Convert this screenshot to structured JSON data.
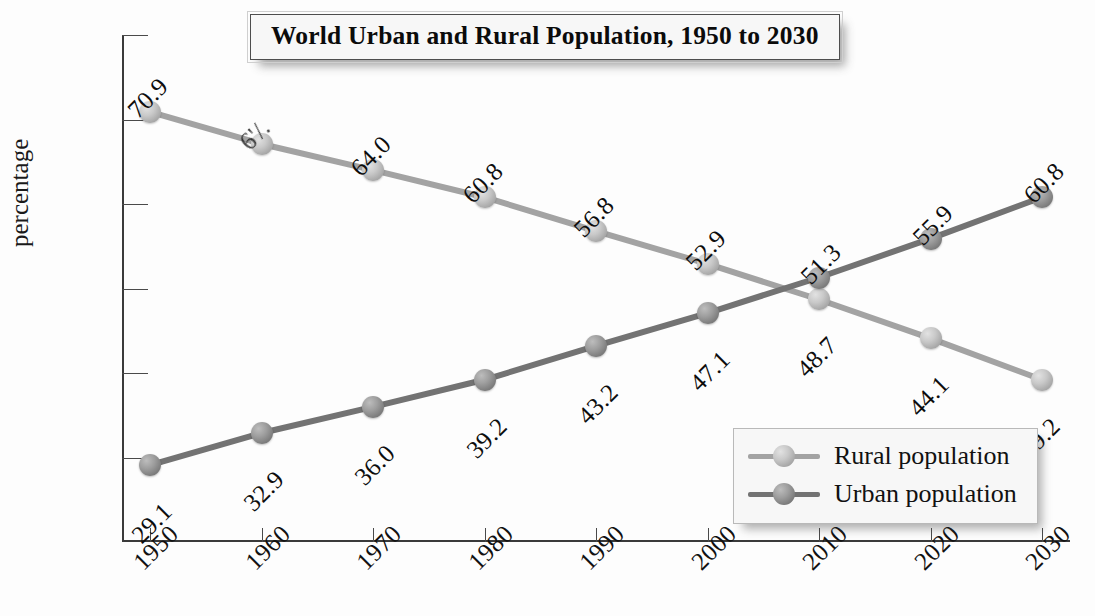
{
  "chart_data": {
    "type": "line",
    "title": "World Urban and Rural Population, 1950 to 2030",
    "xlabel": "",
    "ylabel": "percentage",
    "categories": [
      "1950",
      "1960",
      "1970",
      "1980",
      "1990",
      "2000",
      "2010",
      "2020",
      "2030"
    ],
    "ylim": [
      20,
      80
    ],
    "yticks": [
      "20",
      "30",
      "40",
      "50",
      "60",
      "70",
      "80"
    ],
    "grid": false,
    "legend_position": "bottom-right",
    "series": [
      {
        "name": "Rural population",
        "color": "#a3a3a3",
        "values": [
          70.9,
          67.1,
          64.0,
          60.8,
          56.8,
          52.9,
          48.7,
          44.1,
          39.2
        ],
        "labels": [
          "70.9",
          "6'/.",
          "64.0",
          "60.8",
          "56.8",
          "52.9",
          "48.7",
          "44.1",
          "39.2"
        ],
        "label_degraded_index": 1
      },
      {
        "name": "Urban population",
        "color": "#737373",
        "values": [
          29.1,
          32.9,
          36.0,
          39.2,
          43.2,
          47.1,
          51.3,
          55.9,
          60.8
        ],
        "labels": [
          "29.1",
          "32.9",
          "36.0",
          "39.2",
          "43.2",
          "47.1",
          "51.3",
          "55.9",
          "60.8"
        ]
      }
    ]
  },
  "legend": {
    "items": [
      {
        "label": "Rural population",
        "color": "#a3a3a3"
      },
      {
        "label": "Urban population",
        "color": "#737373"
      }
    ]
  },
  "colors": {
    "rural": "#a3a3a3",
    "urban": "#737373",
    "axis": "#3a3a3a",
    "text": "#111111",
    "background": "#fdfdfd",
    "title_box_fill": "#f7f7f7"
  }
}
